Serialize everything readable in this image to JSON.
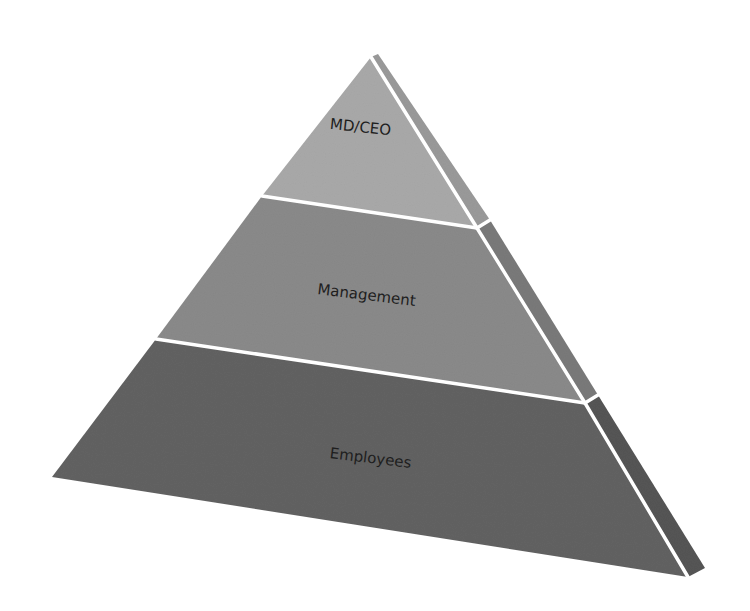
{
  "diagram": {
    "type": "pyramid",
    "levels": [
      {
        "label": "MD/CEO",
        "front_color": "#a9a9a9",
        "side_color": "#9a9a9a"
      },
      {
        "label": "Management",
        "front_color": "#8a8a8a",
        "side_color": "#7a7a7a"
      },
      {
        "label": "Employees",
        "front_color": "#626262",
        "side_color": "#555555"
      }
    ],
    "divider_color": "#ffffff",
    "background": "#ffffff"
  }
}
